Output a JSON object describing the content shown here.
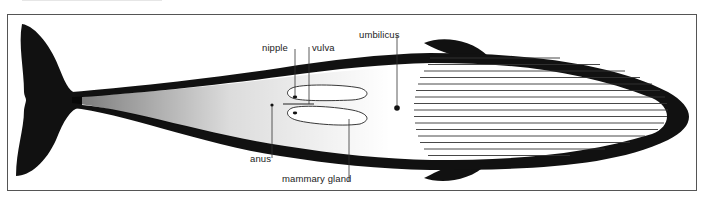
{
  "figure": {
    "colors": {
      "ink": "#111111",
      "frame": "#555555",
      "background": "#ffffff",
      "label_text": "#222222"
    }
  },
  "labels": {
    "nipple": "nipple",
    "vulva": "vulva",
    "umbilicus": "umbilicus",
    "anus": "anus",
    "mammary_gland": "mammary gland"
  },
  "parts": {
    "tail_flukes": "tail-flukes",
    "flippers": [
      "left-flipper",
      "right-flipper"
    ],
    "ventral_grooves_count": 16,
    "head": "rostrum"
  }
}
